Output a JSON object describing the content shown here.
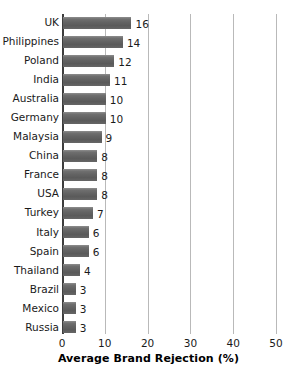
{
  "chart_data": {
    "type": "bar",
    "orientation": "horizontal",
    "title": "",
    "xlabel": "Average Brand Rejection (%)",
    "ylabel": "",
    "xlim": [
      0,
      50
    ],
    "xticks": [
      0,
      10,
      20,
      30,
      40,
      50
    ],
    "grid": true,
    "legend": null,
    "bar_color": "#666666",
    "categories": [
      "UK",
      "Philippines",
      "Poland",
      "India",
      "Australia",
      "Germany",
      "Malaysia",
      "China",
      "France",
      "USA",
      "Turkey",
      "Italy",
      "Spain",
      "Thailand",
      "Brazil",
      "Mexico",
      "Russia"
    ],
    "values": [
      16,
      14,
      12,
      11,
      10,
      10,
      9,
      8,
      8,
      8,
      7,
      6,
      6,
      4,
      3,
      3,
      3
    ],
    "data_labels": [
      "16",
      "14",
      "12",
      "11",
      "10",
      "10",
      "9",
      "8",
      "8",
      "8",
      "7",
      "6",
      "6",
      "4",
      "3",
      "3",
      "3"
    ],
    "tick_labels": [
      "0",
      "10",
      "20",
      "30",
      "40",
      "50"
    ]
  }
}
